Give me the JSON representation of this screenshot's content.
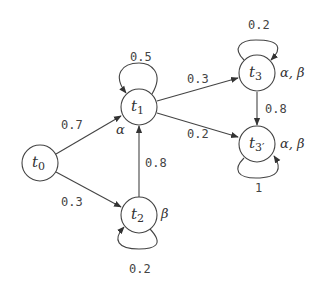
{
  "diagram": {
    "type": "markov-chain-state-transition",
    "nodes": [
      {
        "id": "t0",
        "base": "t",
        "sub": "0",
        "props": ""
      },
      {
        "id": "t1",
        "base": "t",
        "sub": "1",
        "props": "α"
      },
      {
        "id": "t2",
        "base": "t",
        "sub": "2",
        "props": "β"
      },
      {
        "id": "t3",
        "base": "t",
        "sub": "3",
        "props": "α, β"
      },
      {
        "id": "t3p",
        "base": "t",
        "sub": "3′",
        "props": "α, β"
      }
    ],
    "edges": [
      {
        "from": "t0",
        "to": "t1",
        "label": "0.7"
      },
      {
        "from": "t0",
        "to": "t2",
        "label": "0.3"
      },
      {
        "from": "t1",
        "to": "t1",
        "label": "0.5"
      },
      {
        "from": "t1",
        "to": "t3",
        "label": "0.3"
      },
      {
        "from": "t1",
        "to": "t3p",
        "label": "0.2"
      },
      {
        "from": "t2",
        "to": "t1",
        "label": "0.8"
      },
      {
        "from": "t2",
        "to": "t2",
        "label": "0.2"
      },
      {
        "from": "t3",
        "to": "t3",
        "label": "0.2"
      },
      {
        "from": "t3",
        "to": "t3p",
        "label": "0.8"
      },
      {
        "from": "t3p",
        "to": "t3p",
        "label": "1"
      }
    ]
  }
}
